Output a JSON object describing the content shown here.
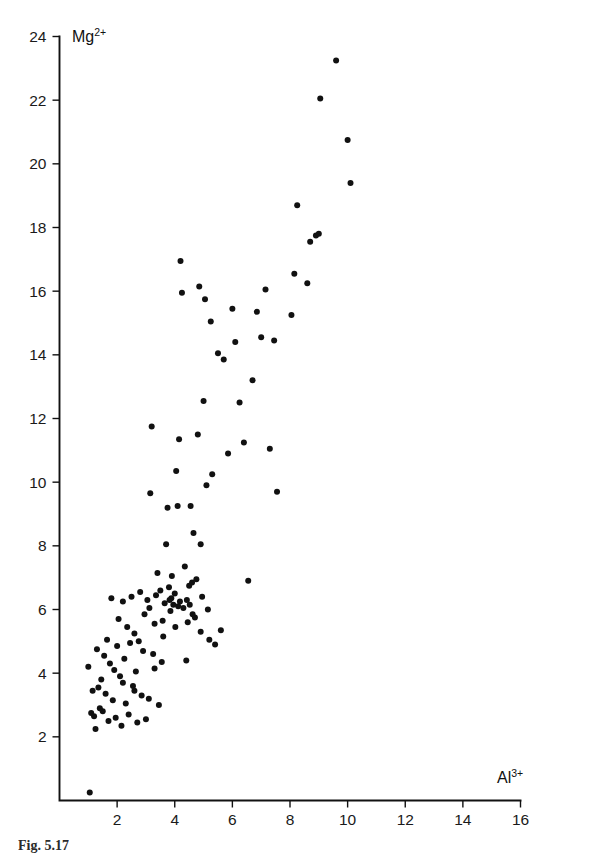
{
  "figure": {
    "caption": "Fig. 5.17",
    "background_color": "#ffffff",
    "ink_color": "#111111"
  },
  "chart_data": {
    "type": "scatter",
    "title": "",
    "subtitle": "",
    "xlabel": "Al3+",
    "xlabel_base": "Al",
    "xlabel_sup": "3+",
    "ylabel": "Mg2+",
    "ylabel_base": "Mg",
    "ylabel_sup": "2+",
    "xlim": [
      0,
      16
    ],
    "ylim": [
      0,
      24
    ],
    "xticks": [
      2,
      4,
      6,
      8,
      10,
      12,
      14,
      16
    ],
    "yticks": [
      2,
      4,
      6,
      8,
      10,
      12,
      14,
      16,
      18,
      20,
      22,
      24
    ],
    "xtick_labels": [
      "2",
      "4",
      "6",
      "8",
      "10",
      "12",
      "14",
      "16"
    ],
    "ytick_labels": [
      "2",
      "4",
      "6",
      "8",
      "10",
      "12",
      "14",
      "16",
      "18",
      "20",
      "22",
      "24"
    ],
    "grid": false,
    "legend": false,
    "legend_position": "none",
    "marker": "circle",
    "marker_size": 3.0,
    "marker_color": "#111111",
    "n_points": 128,
    "series": [
      {
        "name": "samples",
        "points": [
          [
            1.05,
            0.25
          ],
          [
            1.0,
            4.2
          ],
          [
            1.1,
            2.75
          ],
          [
            1.15,
            3.45
          ],
          [
            1.2,
            2.65
          ],
          [
            1.25,
            2.25
          ],
          [
            1.35,
            3.55
          ],
          [
            1.45,
            3.8
          ],
          [
            1.5,
            2.8
          ],
          [
            1.55,
            4.55
          ],
          [
            1.6,
            3.35
          ],
          [
            1.65,
            5.05
          ],
          [
            1.7,
            2.5
          ],
          [
            1.75,
            4.3
          ],
          [
            1.8,
            6.35
          ],
          [
            1.85,
            3.15
          ],
          [
            1.9,
            4.1
          ],
          [
            1.95,
            2.6
          ],
          [
            2.0,
            4.85
          ],
          [
            2.05,
            5.7
          ],
          [
            2.1,
            3.9
          ],
          [
            2.15,
            2.35
          ],
          [
            2.2,
            6.25
          ],
          [
            2.25,
            4.45
          ],
          [
            2.3,
            3.05
          ],
          [
            2.35,
            5.45
          ],
          [
            2.4,
            2.7
          ],
          [
            2.45,
            4.95
          ],
          [
            2.5,
            6.4
          ],
          [
            2.55,
            3.6
          ],
          [
            2.6,
            5.25
          ],
          [
            2.65,
            4.05
          ],
          [
            2.7,
            2.45
          ],
          [
            2.8,
            6.55
          ],
          [
            2.85,
            3.3
          ],
          [
            2.9,
            4.7
          ],
          [
            2.95,
            5.85
          ],
          [
            3.0,
            2.55
          ],
          [
            3.05,
            6.3
          ],
          [
            3.1,
            3.2
          ],
          [
            3.15,
            9.65
          ],
          [
            3.2,
            11.75
          ],
          [
            3.25,
            4.6
          ],
          [
            3.3,
            5.55
          ],
          [
            3.35,
            6.45
          ],
          [
            3.4,
            7.15
          ],
          [
            3.45,
            3.0
          ],
          [
            3.5,
            6.6
          ],
          [
            3.55,
            4.35
          ],
          [
            3.6,
            5.15
          ],
          [
            3.65,
            6.2
          ],
          [
            3.7,
            8.05
          ],
          [
            3.75,
            9.2
          ],
          [
            3.8,
            6.7
          ],
          [
            3.85,
            5.95
          ],
          [
            3.9,
            7.05
          ],
          [
            3.95,
            6.15
          ],
          [
            4.0,
            6.5
          ],
          [
            4.05,
            10.35
          ],
          [
            4.1,
            9.25
          ],
          [
            4.15,
            11.35
          ],
          [
            4.2,
            16.95
          ],
          [
            4.25,
            15.95
          ],
          [
            4.3,
            6.05
          ],
          [
            4.35,
            7.35
          ],
          [
            4.4,
            4.4
          ],
          [
            4.45,
            5.6
          ],
          [
            4.5,
            6.75
          ],
          [
            4.55,
            9.25
          ],
          [
            4.6,
            6.85
          ],
          [
            4.65,
            8.4
          ],
          [
            4.7,
            5.75
          ],
          [
            4.75,
            6.95
          ],
          [
            4.8,
            11.5
          ],
          [
            4.85,
            16.15
          ],
          [
            4.9,
            5.3
          ],
          [
            4.95,
            6.4
          ],
          [
            5.0,
            12.55
          ],
          [
            5.05,
            15.75
          ],
          [
            5.1,
            9.9
          ],
          [
            5.15,
            6.0
          ],
          [
            5.2,
            5.05
          ],
          [
            5.25,
            15.05
          ],
          [
            5.3,
            10.25
          ],
          [
            5.4,
            4.9
          ],
          [
            5.5,
            14.05
          ],
          [
            5.6,
            5.35
          ],
          [
            5.7,
            13.85
          ],
          [
            5.85,
            10.9
          ],
          [
            6.0,
            15.45
          ],
          [
            6.1,
            14.4
          ],
          [
            6.25,
            12.5
          ],
          [
            6.4,
            11.25
          ],
          [
            6.55,
            6.9
          ],
          [
            6.7,
            13.2
          ],
          [
            6.85,
            15.35
          ],
          [
            7.0,
            14.55
          ],
          [
            7.15,
            16.05
          ],
          [
            7.3,
            11.05
          ],
          [
            7.45,
            14.45
          ],
          [
            7.55,
            9.7
          ],
          [
            8.05,
            15.25
          ],
          [
            8.15,
            16.55
          ],
          [
            8.25,
            18.7
          ],
          [
            8.6,
            16.25
          ],
          [
            8.7,
            17.55
          ],
          [
            8.9,
            17.75
          ],
          [
            9.0,
            17.8
          ],
          [
            9.05,
            22.05
          ],
          [
            9.6,
            23.25
          ],
          [
            10.0,
            20.75
          ],
          [
            10.1,
            19.4
          ],
          [
            1.3,
            4.75
          ],
          [
            1.4,
            2.9
          ],
          [
            2.75,
            5.0
          ],
          [
            3.12,
            6.05
          ],
          [
            3.58,
            5.65
          ],
          [
            3.82,
            6.3
          ],
          [
            3.88,
            6.35
          ],
          [
            4.02,
            5.45
          ],
          [
            4.12,
            6.1
          ],
          [
            4.18,
            6.25
          ],
          [
            4.42,
            6.3
          ],
          [
            4.52,
            6.15
          ],
          [
            4.62,
            5.85
          ],
          [
            2.2,
            3.7
          ],
          [
            2.6,
            3.45
          ],
          [
            3.3,
            4.15
          ],
          [
            4.9,
            8.05
          ]
        ]
      }
    ]
  },
  "axes": {
    "y_axis_name": "y-axis",
    "x_axis_name": "x-axis"
  }
}
